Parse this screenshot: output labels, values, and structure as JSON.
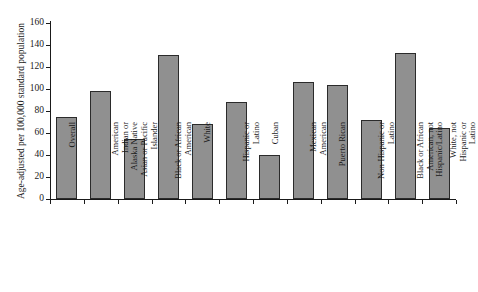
{
  "chart_data": {
    "type": "bar",
    "title": "",
    "xlabel": "",
    "ylabel": "Age-adjusted per 100,000 standard population",
    "ylim": [
      0,
      160
    ],
    "yticks": [
      0,
      20,
      40,
      60,
      80,
      100,
      120,
      140,
      160
    ],
    "grid": false,
    "legend": null,
    "bar_color": "#909090",
    "bar_edge_color": "#2b2b2b",
    "categories": [
      "Overall",
      "American Indian or Alaska Native",
      "Asian or Pacific Islander",
      "Black or African American",
      "White",
      "Hispanic or Latino",
      "Cuban",
      "Mexican American",
      "Puerto Rican",
      "Non-Hispanic or Latino",
      "Black or African American, not Hispanic/Latino",
      "White, not Hispanic or Latino"
    ],
    "category_lines": [
      [
        "Overall"
      ],
      [
        "American",
        "Indian or",
        "Alaska Native"
      ],
      [
        "Asian or Pacific",
        "Islander"
      ],
      [
        "Black or African",
        "American"
      ],
      [
        "White"
      ],
      [
        "Hispanic or",
        "Latino"
      ],
      [
        "Cuban"
      ],
      [
        "Mexican",
        "American"
      ],
      [
        "Puerto Rican"
      ],
      [
        "Non-Hispanic or",
        "Latino"
      ],
      [
        "Black or African",
        "American, not",
        "Hispanic/Latino"
      ],
      [
        "White, not",
        "Hispanic or",
        "Latino"
      ]
    ],
    "values": [
      75,
      98,
      55,
      131,
      68,
      88,
      40,
      106,
      104,
      72,
      133,
      65
    ]
  }
}
